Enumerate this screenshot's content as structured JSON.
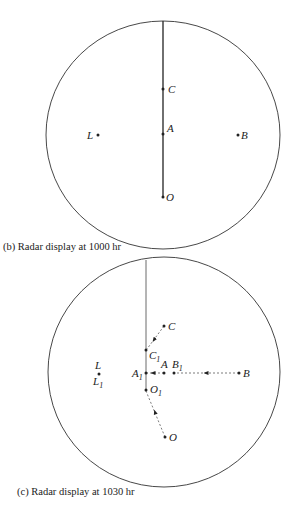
{
  "figures": [
    {
      "id": "b",
      "caption": "(b)  Radar display at 1000 hr",
      "points": {
        "C": {
          "label": "C"
        },
        "A": {
          "label": "A"
        },
        "O": {
          "label": "O"
        },
        "L": {
          "label": "L"
        },
        "B": {
          "label": "B"
        }
      }
    },
    {
      "id": "c",
      "caption": "(c)  Radar display at 1030 hr",
      "points": {
        "C": {
          "label": "C"
        },
        "C1": {
          "label": "C",
          "sub": "1"
        },
        "A": {
          "label": "A"
        },
        "A1": {
          "label": "A",
          "sub": "1"
        },
        "B": {
          "label": "B"
        },
        "B1": {
          "label": "B",
          "sub": "1"
        },
        "O": {
          "label": "O"
        },
        "O1": {
          "label": "O",
          "sub": "1"
        },
        "L": {
          "label": "L"
        },
        "L1": {
          "label": "L",
          "sub": "1"
        }
      }
    }
  ],
  "colors": {
    "ink": "#222222",
    "background": "#ffffff"
  }
}
